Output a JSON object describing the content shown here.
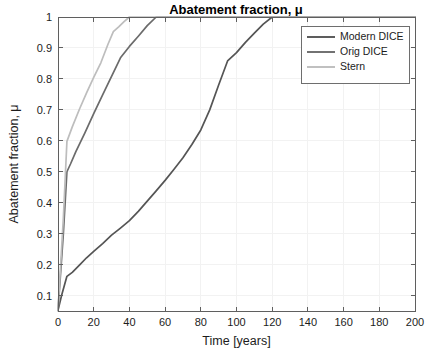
{
  "chart_data": {
    "type": "line",
    "title": "Abatement fraction, μ",
    "xlabel": "Time [years]",
    "ylabel": "Abatement fraction, μ",
    "xlim": [
      0,
      200
    ],
    "ylim": [
      0.05,
      1
    ],
    "xticks": [
      0,
      20,
      40,
      60,
      80,
      100,
      120,
      140,
      160,
      180,
      200
    ],
    "xticklabels": [
      "0",
      "20",
      "40",
      "60",
      "80",
      "100",
      "120",
      "140",
      "160",
      "180",
      "200"
    ],
    "yticks": [
      0.1,
      0.2,
      0.3,
      0.4,
      0.5,
      0.6,
      0.7,
      0.8,
      0.9,
      1
    ],
    "yticklabels": [
      "0.1",
      "0.2",
      "0.3",
      "0.4",
      "0.5",
      "0.6",
      "0.7",
      "0.8",
      "0.9",
      "1"
    ],
    "grid": true,
    "legend_position": "upper right",
    "series": [
      {
        "name": "Modern DICE",
        "color": "#555555",
        "points": [
          [
            0,
            0.052
          ],
          [
            2,
            0.1
          ],
          [
            5,
            0.162
          ],
          [
            8,
            0.175
          ],
          [
            12,
            0.198
          ],
          [
            16,
            0.222
          ],
          [
            20,
            0.243
          ],
          [
            25,
            0.268
          ],
          [
            30,
            0.295
          ],
          [
            35,
            0.318
          ],
          [
            40,
            0.342
          ],
          [
            45,
            0.372
          ],
          [
            50,
            0.405
          ],
          [
            55,
            0.438
          ],
          [
            60,
            0.472
          ],
          [
            65,
            0.508
          ],
          [
            70,
            0.545
          ],
          [
            75,
            0.588
          ],
          [
            80,
            0.635
          ],
          [
            85,
            0.7
          ],
          [
            90,
            0.78
          ],
          [
            95,
            0.858
          ],
          [
            100,
            0.885
          ],
          [
            105,
            0.918
          ],
          [
            110,
            0.948
          ],
          [
            115,
            0.977
          ],
          [
            120,
            1.0
          ],
          [
            200,
            1.0
          ]
        ]
      },
      {
        "name": "Orig DICE",
        "color": "#6b6b6b",
        "points": [
          [
            0,
            0.052
          ],
          [
            3,
            0.3
          ],
          [
            5,
            0.5
          ],
          [
            7,
            0.525
          ],
          [
            10,
            0.565
          ],
          [
            15,
            0.625
          ],
          [
            20,
            0.688
          ],
          [
            25,
            0.748
          ],
          [
            30,
            0.808
          ],
          [
            35,
            0.868
          ],
          [
            40,
            0.905
          ],
          [
            45,
            0.938
          ],
          [
            50,
            0.972
          ],
          [
            55,
            1.0
          ],
          [
            200,
            1.0
          ]
        ]
      },
      {
        "name": "Stern",
        "color": "#bdbdbd",
        "points": [
          [
            0,
            0.052
          ],
          [
            3,
            0.35
          ],
          [
            5,
            0.598
          ],
          [
            8,
            0.645
          ],
          [
            12,
            0.702
          ],
          [
            16,
            0.755
          ],
          [
            20,
            0.805
          ],
          [
            24,
            0.852
          ],
          [
            28,
            0.912
          ],
          [
            31,
            0.953
          ],
          [
            34,
            0.968
          ],
          [
            37,
            0.985
          ],
          [
            40,
            1.0
          ],
          [
            200,
            1.0
          ]
        ]
      }
    ]
  },
  "legend": {
    "entries": [
      {
        "label": "Modern DICE",
        "color": "#555555"
      },
      {
        "label": "Orig DICE",
        "color": "#6b6b6b"
      },
      {
        "label": "Stern",
        "color": "#bdbdbd"
      }
    ]
  }
}
